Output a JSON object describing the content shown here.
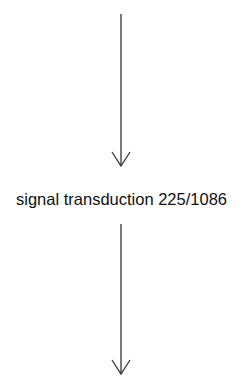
{
  "diagram": {
    "nodes": [
      {
        "id": "signal-transduction",
        "label": "signal transduction 225/1086"
      }
    ],
    "edges": [
      {
        "from": "previous-node",
        "to": "signal-transduction",
        "direction": "down"
      },
      {
        "from": "signal-transduction",
        "to": "next-node",
        "direction": "down"
      }
    ],
    "colors": {
      "line": "#333333",
      "text": "#111111",
      "background": "#ffffff"
    }
  }
}
